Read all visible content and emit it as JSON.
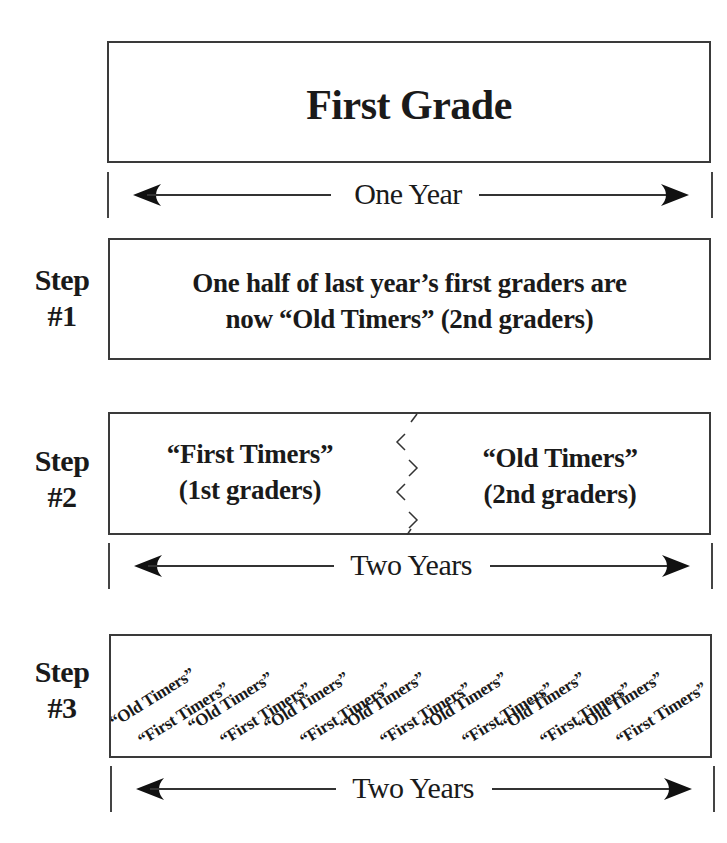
{
  "header": {
    "title": "First Grade"
  },
  "rulers": [
    {
      "label": "One Year"
    },
    {
      "label": "Two Years"
    },
    {
      "label": "Two Years"
    }
  ],
  "steps": [
    {
      "label_line1": "Step",
      "label_line2": "#1",
      "text_line1": "One half of last year’s first graders are",
      "text_line2": "now “Old Timers” (2nd graders)"
    },
    {
      "label_line1": "Step",
      "label_line2": "#2",
      "left_line1": "“First Timers”",
      "left_line2": "(1st graders)",
      "right_line1": "“Old Timers”",
      "right_line2": "(2nd graders)"
    },
    {
      "label_line1": "Step",
      "label_line2": "#3",
      "mixed_labels": [
        "“Old Timers”",
        "“First Timers”",
        "“Old Timers”",
        "“First Timers”",
        "“Old Timers”",
        "“First Timers”",
        "“Old Timers”",
        "“First Timers”",
        "“Old Timers”",
        "“First Timers”",
        "“Old Timers”",
        "“First Timers”",
        "“Old Timers”",
        "“First Timers”"
      ]
    }
  ]
}
